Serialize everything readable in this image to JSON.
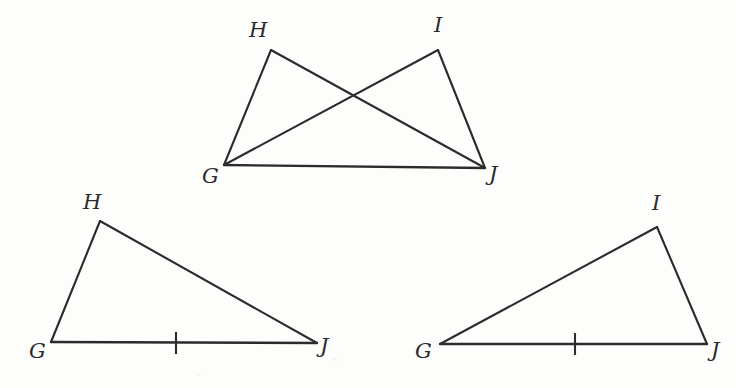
{
  "figure": {
    "background_color": "#fdfdfb",
    "line_color": "#2b2b2b",
    "label_color": "#2b2b2b"
  },
  "diagrams": [
    {
      "id": "overlapping-triangles",
      "name": "Overlapping triangles GHJ and GIJ",
      "vertices": [
        {
          "label": "H",
          "x": 271,
          "y": 50,
          "label_x": 249,
          "label_y": 20
        },
        {
          "label": "I",
          "x": 438,
          "y": 50,
          "label_x": 434,
          "label_y": 15
        },
        {
          "label": "G",
          "x": 224,
          "y": 165,
          "label_x": 202,
          "label_y": 166
        },
        {
          "label": "J",
          "x": 485,
          "y": 168,
          "label_x": 489,
          "label_y": 164
        }
      ],
      "segments": [
        {
          "from": "G",
          "to": "H"
        },
        {
          "from": "H",
          "to": "J"
        },
        {
          "from": "G",
          "to": "I"
        },
        {
          "from": "I",
          "to": "J"
        },
        {
          "from": "G",
          "to": "J"
        }
      ],
      "intersection": {
        "x": 352,
        "y": 95
      },
      "tick_marks": []
    },
    {
      "id": "triangle-ghj",
      "name": "Triangle GHJ",
      "vertices": [
        {
          "label": "H",
          "x": 100,
          "y": 221,
          "label_x": 83,
          "label_y": 192
        },
        {
          "label": "G",
          "x": 51,
          "y": 342,
          "label_x": 29,
          "label_y": 341
        },
        {
          "label": "J",
          "x": 317,
          "y": 343,
          "label_x": 320,
          "label_y": 336
        }
      ],
      "segments": [
        {
          "from": "G",
          "to": "H"
        },
        {
          "from": "H",
          "to": "J"
        },
        {
          "from": "G",
          "to": "J"
        }
      ],
      "tick_marks": [
        {
          "on": "GJ",
          "x": 176,
          "y": 343,
          "half_length": 11
        }
      ]
    },
    {
      "id": "triangle-gij",
      "name": "Triangle GIJ",
      "vertices": [
        {
          "label": "I",
          "x": 657,
          "y": 227,
          "label_x": 652,
          "label_y": 193
        },
        {
          "label": "G",
          "x": 440,
          "y": 344,
          "label_x": 415,
          "label_y": 341
        },
        {
          "label": "J",
          "x": 707,
          "y": 344,
          "label_x": 711,
          "label_y": 340
        }
      ],
      "segments": [
        {
          "from": "G",
          "to": "I"
        },
        {
          "from": "I",
          "to": "J"
        },
        {
          "from": "G",
          "to": "J"
        }
      ],
      "tick_marks": [
        {
          "on": "GJ",
          "x": 575,
          "y": 344,
          "half_length": 11
        }
      ]
    }
  ]
}
